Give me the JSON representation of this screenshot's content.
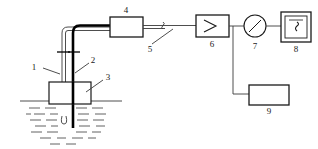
{
  "diagram": {
    "background_color": "#ffffff",
    "line_color": "#3a3a3a",
    "dark_line_color": "#000000",
    "labels": [
      {
        "id": "1",
        "text": "1",
        "refers_to": "thin-tube-probe-line"
      },
      {
        "id": "2",
        "text": "2",
        "refers_to": "thick-rod-probe-line"
      },
      {
        "id": "3",
        "text": "3",
        "refers_to": "holder-block"
      },
      {
        "id": "4",
        "text": "4",
        "refers_to": "inline-unit-box"
      },
      {
        "id": "5",
        "text": "5",
        "refers_to": "signal-line-tick"
      },
      {
        "id": "6",
        "text": "6",
        "refers_to": "amplifier-box"
      },
      {
        "id": "7",
        "text": "7",
        "refers_to": "dial-gauge"
      },
      {
        "id": "8",
        "text": "8",
        "refers_to": "display-meter"
      },
      {
        "id": "9",
        "text": "9",
        "refers_to": "lower-unit-box"
      }
    ],
    "components": {
      "inline_unit": {
        "label": "4"
      },
      "amplifier": {
        "label": "6",
        "symbol": "triangle-amplifier-symbol"
      },
      "gauge": {
        "label": "7",
        "symbol": "needle-dial"
      },
      "display": {
        "label": "8",
        "symbol": "waveform-glyph"
      },
      "lower_unit": {
        "label": "9"
      },
      "holder": {
        "label": "3"
      }
    },
    "liquid": {
      "name": "liquid-bath",
      "surface_line": true,
      "hatch_rows": 7
    }
  }
}
